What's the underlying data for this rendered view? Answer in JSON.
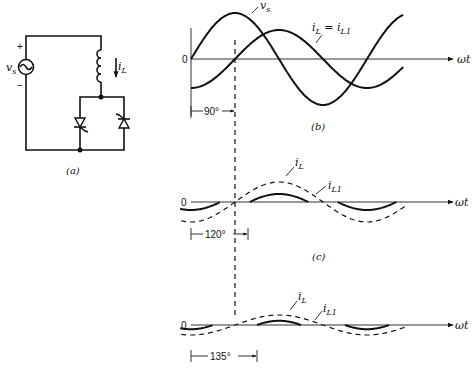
{
  "circuit": {
    "caption": "(a)",
    "source_label": "v",
    "source_sub": "s",
    "plus": "+",
    "minus": "−",
    "current_label": "i",
    "current_sub": "L"
  },
  "plots": [
    {
      "id": "b",
      "caption": "(b)",
      "zero_label": "0",
      "x_label": "ωt",
      "angle_label": "90°",
      "alpha_deg": 90,
      "curve_labels": [
        {
          "main": "v",
          "sub": "s"
        },
        {
          "main": "i",
          "sub": "L",
          "eq": " = ",
          "main2": "i",
          "sub2": "L1"
        }
      ]
    },
    {
      "id": "c",
      "caption": "(c)",
      "zero_label": "0",
      "x_label": "ωt",
      "angle_label": "120°",
      "alpha_deg": 120,
      "curve_labels": [
        {
          "main": "i",
          "sub": "L"
        },
        {
          "main": "i",
          "sub": "L1"
        }
      ]
    },
    {
      "id": "d",
      "caption": "",
      "zero_label": "0",
      "x_label": "ωt",
      "angle_label": "135°",
      "alpha_deg": 135,
      "curve_labels": [
        {
          "main": "i",
          "sub": "L"
        },
        {
          "main": "i",
          "sub": "L1"
        }
      ]
    }
  ],
  "chart_data": [
    {
      "type": "line",
      "title": "(b) α = 90°",
      "xlabel": "ωt",
      "series": [
        {
          "name": "v_s",
          "function": "sin(ωt)",
          "amplitude": 1.0
        },
        {
          "name": "i_L = i_L1",
          "function": "-cos(ωt)",
          "amplitude": 0.63
        }
      ],
      "annotations": [
        "90°"
      ]
    },
    {
      "type": "line",
      "title": "(c) α = 120°",
      "xlabel": "ωt",
      "series": [
        {
          "name": "i_L",
          "style": "solid",
          "conduction_deg": [
            [
              120,
              240
            ],
            [
              300,
              420
            ]
          ],
          "peak": 0.52
        },
        {
          "name": "i_L1",
          "style": "dashed",
          "function": "fundamental, lagging v_s by 90°",
          "amplitude": 0.43
        }
      ],
      "annotations": [
        "120°"
      ]
    },
    {
      "type": "line",
      "title": "(d) α = 135°",
      "xlabel": "ωt",
      "series": [
        {
          "name": "i_L",
          "style": "solid",
          "conduction_deg": [
            [
              135,
              225
            ],
            [
              315,
              405
            ]
          ],
          "peak": 0.3
        },
        {
          "name": "i_L1",
          "style": "dashed",
          "function": "fundamental, lagging v_s by 90°",
          "amplitude": 0.22
        }
      ],
      "annotations": [
        "135°"
      ]
    }
  ]
}
